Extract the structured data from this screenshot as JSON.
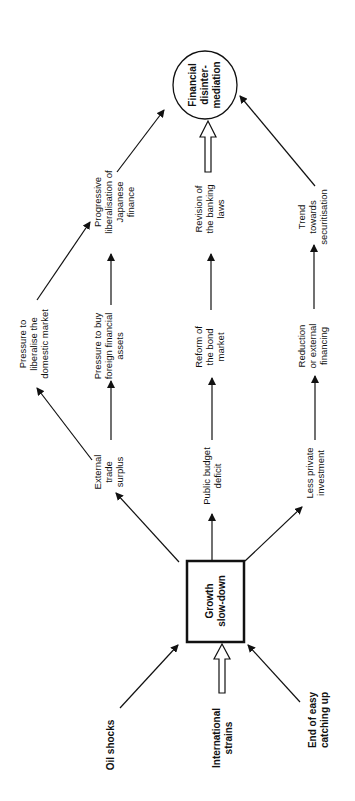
{
  "diagram": {
    "orientation": "rotated-90-ccw",
    "central_node": {
      "label_lines": [
        "Growth",
        "slow-down"
      ],
      "shape": "rectangle"
    },
    "outcome_node": {
      "label_lines": [
        "Financial",
        "disinter-",
        "mediation"
      ],
      "shape": "circle"
    },
    "causes": [
      {
        "id": "oil",
        "label_lines": [
          "Oil shocks"
        ]
      },
      {
        "id": "intl",
        "label_lines": [
          "International",
          "strains"
        ],
        "arrow": "hollow"
      },
      {
        "id": "catchup",
        "label_lines": [
          "End of easy",
          "catching up"
        ]
      }
    ],
    "effects": [
      {
        "id": "trade",
        "label_lines": [
          "External",
          "trade",
          "surplus"
        ]
      },
      {
        "id": "budget",
        "label_lines": [
          "Public budget",
          "deficit"
        ]
      },
      {
        "id": "invest",
        "label_lines": [
          "Less private",
          "investment"
        ]
      }
    ],
    "intermediate": [
      {
        "id": "liberalise",
        "label_lines": [
          "Pressure to",
          "liberalise the",
          "domestic market"
        ]
      },
      {
        "id": "foreign",
        "label_lines": [
          "Pressure to buy",
          "foreign financial",
          "assets"
        ]
      },
      {
        "id": "bond",
        "label_lines": [
          "Reform of",
          "the bond",
          "market"
        ]
      },
      {
        "id": "financing",
        "label_lines": [
          "Reduction",
          "or external",
          "financing"
        ]
      }
    ],
    "final_stage": [
      {
        "id": "progressive",
        "label_lines": [
          "Progressive",
          "liberalisation of",
          "Japanese",
          "finance"
        ]
      },
      {
        "id": "banking",
        "label_lines": [
          "Revision of",
          "the banking",
          "laws"
        ]
      },
      {
        "id": "securitisation",
        "label_lines": [
          "Trend",
          "towards",
          "securitisation"
        ]
      }
    ]
  }
}
